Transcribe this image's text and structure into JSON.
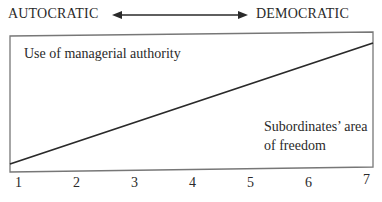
{
  "diagram": {
    "scale_left": "AUTOCRATIC",
    "scale_right": "DEMOCRATIC",
    "upper_region_label": "Use of managerial authority",
    "lower_region_label_line1": "Subordinates’ area",
    "lower_region_label_line2": "of freedom",
    "ticks": [
      "1",
      "2",
      "3",
      "4",
      "5",
      "6",
      "7"
    ],
    "colors": {
      "line": "#2a2a2a",
      "border": "#777777",
      "background": "#ffffff"
    }
  }
}
